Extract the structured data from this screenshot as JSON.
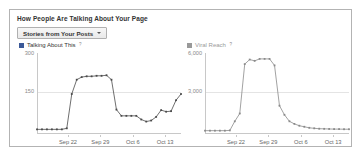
{
  "panel": {
    "title": "How People Are Talking About Your Page",
    "filter_dropdown": {
      "label": "Stories from Your Posts",
      "caret_icon": "chevron-down-icon"
    }
  },
  "colors": {
    "talking_about_this": "#3b5998",
    "viral_reach": "#999999",
    "axis": "#c8c8c8",
    "grid": "#e4e4e4",
    "panel_border": "#b3b3b3",
    "title_text": "#333333",
    "tick_text": "#8a8a8a"
  },
  "chart_data": [
    {
      "type": "line",
      "title": "Talking About This",
      "help_icon_label": "?",
      "legend_color": "#3b5998",
      "legend_position": "top-left",
      "xlabel": "",
      "ylabel": "",
      "ylim": [
        0,
        300
      ],
      "yticks": [
        300,
        150
      ],
      "ytick_labels": [
        "300",
        "150"
      ],
      "grid": true,
      "xticks": [
        "Sep 22",
        "Sep 29",
        "Oct 6",
        "Oct 13"
      ],
      "xtick_positions": [
        0.215,
        0.44,
        0.665,
        0.89
      ],
      "x": [
        "Sep 16",
        "Sep 17",
        "Sep 18",
        "Sep 19",
        "Sep 20",
        "Sep 21",
        "Sep 22",
        "Sep 23",
        "Sep 24",
        "Sep 25",
        "Sep 26",
        "Sep 27",
        "Sep 28",
        "Sep 29",
        "Sep 30",
        "Oct 1",
        "Oct 2",
        "Oct 3",
        "Oct 4",
        "Oct 5",
        "Oct 6",
        "Oct 7",
        "Oct 8",
        "Oct 9",
        "Oct 10",
        "Oct 11",
        "Oct 12",
        "Oct 13",
        "Oct 14",
        "Oct 15"
      ],
      "values": [
        14,
        14,
        14,
        14,
        14,
        14,
        18,
        150,
        205,
        215,
        218,
        218,
        220,
        220,
        222,
        205,
        90,
        66,
        66,
        66,
        66,
        52,
        44,
        48,
        62,
        88,
        82,
        84,
        126,
        150
      ]
    },
    {
      "type": "line",
      "title": "Viral Reach",
      "help_icon_label": "?",
      "legend_color": "#999999",
      "legend_position": "top-left",
      "xlabel": "",
      "ylabel": "",
      "ylim": [
        0,
        6000
      ],
      "yticks": [
        6000,
        3000
      ],
      "ytick_labels": [
        "6,000",
        "3,000"
      ],
      "grid": true,
      "xticks": [
        "Sep 22",
        "Sep 29",
        "Oct 6",
        "Oct 13"
      ],
      "xtick_positions": [
        0.215,
        0.44,
        0.665,
        0.89
      ],
      "x": [
        "Sep 16",
        "Sep 17",
        "Sep 18",
        "Sep 19",
        "Sep 20",
        "Sep 21",
        "Sep 22",
        "Sep 23",
        "Sep 24",
        "Sep 25",
        "Sep 26",
        "Sep 27",
        "Sep 28",
        "Sep 29",
        "Sep 30",
        "Oct 1",
        "Oct 2",
        "Oct 3",
        "Oct 4",
        "Oct 5",
        "Oct 6",
        "Oct 7",
        "Oct 8",
        "Oct 9",
        "Oct 10",
        "Oct 11",
        "Oct 12",
        "Oct 13",
        "Oct 14",
        "Oct 15"
      ],
      "values": [
        180,
        180,
        180,
        180,
        180,
        200,
        900,
        1500,
        5300,
        5650,
        5550,
        5700,
        5700,
        5700,
        5200,
        2100,
        1400,
        900,
        700,
        560,
        480,
        400,
        360,
        330,
        320,
        310,
        300,
        300,
        290,
        290
      ]
    }
  ]
}
